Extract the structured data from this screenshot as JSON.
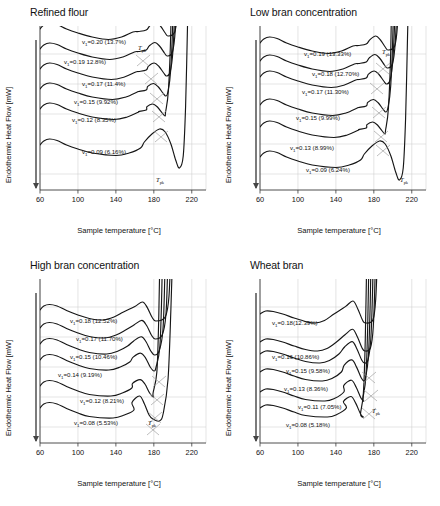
{
  "figure": {
    "panel_count": 4,
    "axis": {
      "xlabel": "Sample temperature [°C]",
      "ylabel": "Endothermic Heat Flow  [mW]",
      "xticks": [
        "60",
        "100",
        "140",
        "180",
        "220"
      ],
      "xlim": [
        60,
        235
      ],
      "grid": true,
      "tpk_label": "T",
      "tpk_sub": "pk"
    }
  },
  "chart_data": [
    {
      "type": "line",
      "title": "Refined flour",
      "xlabel": "Sample temperature [°C]",
      "ylabel": "Endothermic Heat Flow  [mW]",
      "xlim": [
        60,
        235
      ],
      "xticks": [
        60,
        100,
        140,
        180,
        220
      ],
      "grid": true,
      "legend": "inline-annotations",
      "annotations": [
        "T_pk"
      ],
      "series": [
        {
          "name": "v1=0.20 (13.7%)",
          "label": "v",
          "sub": "1",
          "value": "=0.20 (13.7%)",
          "moisture": 13.7,
          "v": 0.2,
          "offset": 6
        },
        {
          "name": "v1=0.19 12.8%)",
          "label": "v",
          "sub": "1",
          "value": "=0.19 12.8%)",
          "moisture": 12.8,
          "v": 0.19,
          "offset": 26
        },
        {
          "name": "v1=0.17 (11.4%)",
          "label": "v",
          "sub": "1",
          "value": "=0.17 (11.4%)",
          "moisture": 11.4,
          "v": 0.17,
          "offset": 46
        },
        {
          "name": "v1=0.15 (9.92%)",
          "label": "v",
          "sub": "1",
          "value": "=0.15 (9.92%)",
          "moisture": 9.92,
          "v": 0.15,
          "offset": 66
        },
        {
          "name": "v1=0.12 (8.35%)",
          "label": "v",
          "sub": "1",
          "value": "=0.12 (8.35%)",
          "moisture": 8.35,
          "v": 0.12,
          "offset": 86
        },
        {
          "name": "v1=0.09 (6.16%)",
          "label": "v",
          "sub": "1",
          "value": "=0.09 (6.16%)",
          "moisture": 6.16,
          "v": 0.09,
          "offset": 122
        }
      ]
    },
    {
      "type": "line",
      "title": "Low bran concentration",
      "xlabel": "Sample temperature [°C]",
      "ylabel": "Endothermic Heat Flow  [mW]",
      "xlim": [
        60,
        235
      ],
      "xticks": [
        60,
        100,
        140,
        180,
        220
      ],
      "grid": true,
      "legend": "inline-annotations",
      "annotations": [
        "T_pk"
      ],
      "series": [
        {
          "name": "v1=0.19 (13.33%)",
          "label": "v",
          "sub": "1",
          "value": "=0.19 (13.33%)",
          "moisture": 13.33,
          "v": 0.19,
          "offset": 20
        },
        {
          "name": "v1=0.18 (12.70%)",
          "label": "v",
          "sub": "1",
          "value": "=0.18 (12.70%)",
          "moisture": 12.7,
          "v": 0.18,
          "offset": 38
        },
        {
          "name": "v1=0.17 (11.30%)",
          "label": "v",
          "sub": "1",
          "value": "=0.17 (11.30%)",
          "moisture": 11.3,
          "v": 0.17,
          "offset": 54
        },
        {
          "name": "v1=0.15 (9.99%)",
          "label": "v",
          "sub": "1",
          "value": "=0.15 (9.99%)",
          "moisture": 9.99,
          "v": 0.15,
          "offset": 82
        },
        {
          "name": "v1=0.13 (8.99%)",
          "label": "v",
          "sub": "1",
          "value": "=0.13 (8.99%)",
          "moisture": 8.99,
          "v": 0.13,
          "offset": 104
        },
        {
          "name": "v1=0.09 (6.24%)",
          "label": "v",
          "sub": "1",
          "value": "=0.09 (6.24%)",
          "moisture": 6.24,
          "v": 0.09,
          "offset": 134
        }
      ]
    },
    {
      "type": "line",
      "title": "High bran concentration",
      "xlabel": "Sample temperature [°C]",
      "ylabel": "Endothermic Heat Flow  [mW]",
      "xlim": [
        60,
        235
      ],
      "xticks": [
        60,
        100,
        140,
        180,
        220
      ],
      "grid": true,
      "legend": "inline-annotations",
      "annotations": [
        "T_pk"
      ],
      "series": [
        {
          "name": "v1=0.18 (12.52%)",
          "label": "v",
          "sub": "1",
          "value": "=0.18 (12.52%)",
          "moisture": 12.52,
          "v": 0.18,
          "offset": 34
        },
        {
          "name": "v1=0.17 (11.70%)",
          "label": "v",
          "sub": "1",
          "value": "=0.17 (11.70%)",
          "moisture": 11.7,
          "v": 0.17,
          "offset": 52
        },
        {
          "name": "v1=0.15 (10.46%)",
          "label": "v",
          "sub": "1",
          "value": "=0.15 (10.46%)",
          "moisture": 10.46,
          "v": 0.15,
          "offset": 68
        },
        {
          "name": "v1=0.14 (9.19%)",
          "label": "v",
          "sub": "1",
          "value": "=0.14 (9.19%)",
          "moisture": 9.19,
          "v": 0.14,
          "offset": 84
        },
        {
          "name": "v1=0.12 (8.21%)",
          "label": "v",
          "sub": "1",
          "value": "=0.12 (8.21%)",
          "moisture": 8.21,
          "v": 0.12,
          "offset": 110
        },
        {
          "name": "v1=0.08 (5.53%)",
          "label": "v",
          "sub": "1",
          "value": "=0.08 (5.53%)",
          "moisture": 5.53,
          "v": 0.08,
          "offset": 132
        }
      ]
    },
    {
      "type": "line",
      "title": "Wheat bran",
      "xlabel": "Sample temperature [°C]",
      "ylabel": "Endothermic Heat Flow  [mW]",
      "xlim": [
        60,
        235
      ],
      "xticks": [
        60,
        100,
        140,
        180,
        220
      ],
      "grid": true,
      "legend": "inline-annotations",
      "annotations": [
        "T_pk"
      ],
      "series": [
        {
          "name": "v1=0.18(12.39%)",
          "label": "v",
          "sub": "1",
          "value": "=0.18(12.39%)",
          "moisture": 12.39,
          "v": 0.18,
          "offset": 38
        },
        {
          "name": "v1=0.16 (10.86%)",
          "label": "v",
          "sub": "1",
          "value": "=0.16 (10.86%)",
          "moisture": 10.86,
          "v": 0.16,
          "offset": 66
        },
        {
          "name": "v1=0.15 (9.58%)",
          "label": "v",
          "sub": "1",
          "value": "=0.15 (9.58%)",
          "moisture": 9.58,
          "v": 0.15,
          "offset": 78
        },
        {
          "name": "v1=0.13 (8.36%)",
          "label": "v",
          "sub": "1",
          "value": "=0.13 (8.36%)",
          "moisture": 8.36,
          "v": 0.13,
          "offset": 96
        },
        {
          "name": "v1=0.11 (7.05%)",
          "label": "v",
          "sub": "1",
          "value": "=0.11 (7.05%)",
          "moisture": 7.05,
          "v": 0.11,
          "offset": 116
        },
        {
          "name": "v1=0.08 (5.18%)",
          "label": "v",
          "sub": "1",
          "value": "=0.08 (5.18%)",
          "moisture": 5.18,
          "v": 0.08,
          "offset": 132
        }
      ]
    }
  ]
}
